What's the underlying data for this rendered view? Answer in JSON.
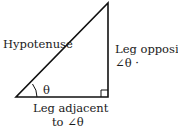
{
  "diagram": {
    "colors": {
      "stroke": "#111111",
      "text": "#1a1a1a",
      "background": "#ffffff"
    },
    "labels": {
      "hypotenuse": "Hypotenuse",
      "opposite_line1": "Leg opposite",
      "opposite_line2": "∠θ ·",
      "adjacent_line1": "Leg adjacent",
      "adjacent_line2": "to ∠θ",
      "angle": "θ"
    },
    "vertices": {
      "angle_vertex": [
        16,
        97
      ],
      "right_angle_vertex": [
        108,
        97
      ],
      "apex": [
        108,
        3
      ]
    }
  }
}
